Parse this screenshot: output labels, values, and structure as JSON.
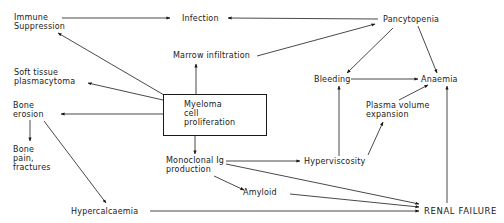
{
  "diagram": {
    "type": "flowchart",
    "central_node": "Myeloma cell proliferation",
    "nodes": {
      "immune_suppression": "Immune\nSuppression",
      "infection": "Infection",
      "pancytopenia": "Pancytopenia",
      "marrow_infiltration": "Marrow infiltration",
      "soft_tissue": "Soft tissue\nplasmacytoma",
      "bleeding": "Bleeding",
      "anaemia": "Anaemia",
      "bone_erosion": "Bone\nerosion",
      "myeloma": "Myeloma\ncell\nproliferation",
      "plasma_volume": "Plasma volume\nexpansion",
      "bone_pain": "Bone\npain,\nfractures",
      "monoclonal": "Monoclonal Ig\nproduction",
      "hyperviscosity": "Hyperviscosity",
      "amyloid": "Amyloid",
      "hypercalcaemia": "Hypercalcaemia",
      "renal_failure": "RENAL FAILURE"
    },
    "edges": [
      {
        "from": "Immune Suppression",
        "to": "Infection"
      },
      {
        "from": "Pancytopenia",
        "to": "Infection"
      },
      {
        "from": "Marrow infiltration",
        "to": "Pancytopenia"
      },
      {
        "from": "Pancytopenia",
        "to": "Bleeding"
      },
      {
        "from": "Pancytopenia",
        "to": "Anaemia"
      },
      {
        "from": "Bleeding",
        "to": "Anaemia"
      },
      {
        "from": "Plasma volume expansion",
        "to": "Anaemia"
      },
      {
        "from": "Myeloma cell proliferation",
        "to": "Immune Suppression"
      },
      {
        "from": "Myeloma cell proliferation",
        "to": "Soft tissue plasmacytoma"
      },
      {
        "from": "Myeloma cell proliferation",
        "to": "Bone erosion"
      },
      {
        "from": "Myeloma cell proliferation",
        "to": "Marrow infiltration"
      },
      {
        "from": "Myeloma cell proliferation",
        "to": "Monoclonal Ig production"
      },
      {
        "from": "Bone erosion",
        "to": "Bone pain, fractures"
      },
      {
        "from": "Bone erosion",
        "to": "Hypercalcaemia"
      },
      {
        "from": "Monoclonal Ig production",
        "to": "Hyperviscosity"
      },
      {
        "from": "Monoclonal Ig production",
        "to": "Amyloid"
      },
      {
        "from": "Monoclonal Ig production",
        "to": "RENAL FAILURE"
      },
      {
        "from": "Amyloid",
        "to": "RENAL FAILURE"
      },
      {
        "from": "Hypercalcaemia",
        "to": "RENAL FAILURE"
      },
      {
        "from": "Hyperviscosity",
        "to": "Bleeding"
      },
      {
        "from": "Hyperviscosity",
        "to": "Plasma volume expansion"
      },
      {
        "from": "RENAL FAILURE",
        "to": "Anaemia"
      }
    ]
  }
}
